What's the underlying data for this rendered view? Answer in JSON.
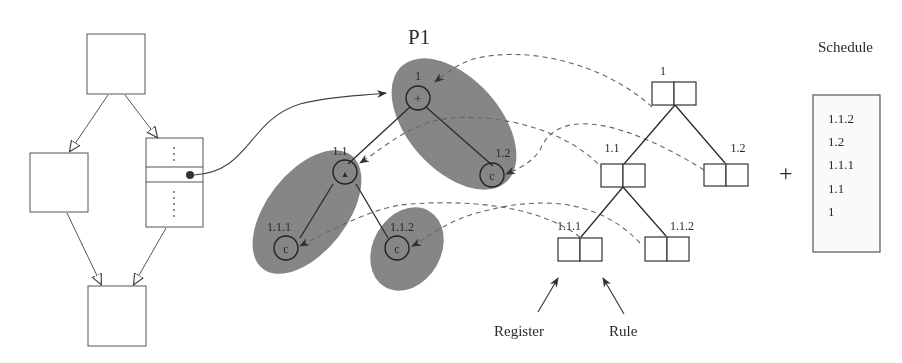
{
  "diagram": {
    "title_p1": "P1",
    "schedule_title": "Schedule",
    "plus_sign": "+",
    "flow_graph": {
      "blocks": [
        "top-block",
        "left-block",
        "right-block",
        "bottom-block"
      ],
      "dots": "⋮"
    },
    "expression_tree": {
      "nodes": [
        {
          "id": "1",
          "label": "1",
          "symbol": "+"
        },
        {
          "id": "1.1",
          "label": "1.1",
          "symbol": "▴"
        },
        {
          "id": "1.2",
          "label": "1.2",
          "symbol": "c"
        },
        {
          "id": "1.1.1",
          "label": "1.1.1",
          "symbol": "c"
        },
        {
          "id": "1.1.2",
          "label": "1.1.2",
          "symbol": "c"
        }
      ]
    },
    "register_tree": {
      "nodes": [
        {
          "id": "1",
          "label": "1"
        },
        {
          "id": "1.1",
          "label": "1.1"
        },
        {
          "id": "1.2",
          "label": "1.2"
        },
        {
          "id": "1.1.1",
          "label": "1.1.1"
        },
        {
          "id": "1.1.2",
          "label": "1.1.2"
        }
      ],
      "register_label": "Register",
      "rule_label": "Rule"
    },
    "schedule": [
      "1.1.2",
      "1.2",
      "1.1.1",
      "1.1",
      "1"
    ]
  }
}
